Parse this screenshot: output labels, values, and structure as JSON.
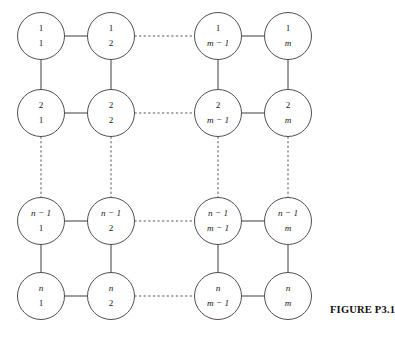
{
  "figure": {
    "caption": "FIGURE P3.1",
    "caption_x": 330,
    "caption_y": 304,
    "background_color": "#ffffff",
    "stroke_color": "#3c3c3c",
    "text_color": "#1a1a1a"
  },
  "diagram": {
    "type": "grid-graph",
    "rows": 4,
    "cols": 4,
    "radius": 23.5,
    "row_labels": [
      "1",
      "2",
      "n − 1",
      "n"
    ],
    "col_labels": [
      "1",
      "2",
      "m − 1",
      "m"
    ],
    "row_centers": [
      36,
      113,
      221,
      296
    ],
    "col_centers": [
      41,
      111,
      218,
      288
    ],
    "row_label_italic": [
      false,
      false,
      true,
      true
    ],
    "col_label_italic": [
      false,
      false,
      true,
      true
    ],
    "nodes": [
      {
        "id": "n-0-0",
        "row": 0,
        "col": 0,
        "top": "1",
        "bottom": "1",
        "top_italic": false,
        "bottom_italic": false,
        "cx": 41,
        "cy": 36
      },
      {
        "id": "n-0-1",
        "row": 0,
        "col": 1,
        "top": "1",
        "bottom": "2",
        "top_italic": false,
        "bottom_italic": false,
        "cx": 111,
        "cy": 36
      },
      {
        "id": "n-0-2",
        "row": 0,
        "col": 2,
        "top": "1",
        "bottom": "m − 1",
        "top_italic": false,
        "bottom_italic": true,
        "cx": 218,
        "cy": 36
      },
      {
        "id": "n-0-3",
        "row": 0,
        "col": 3,
        "top": "1",
        "bottom": "m",
        "top_italic": false,
        "bottom_italic": true,
        "cx": 288,
        "cy": 36
      },
      {
        "id": "n-1-0",
        "row": 1,
        "col": 0,
        "top": "2",
        "bottom": "1",
        "top_italic": false,
        "bottom_italic": false,
        "cx": 41,
        "cy": 113
      },
      {
        "id": "n-1-1",
        "row": 1,
        "col": 1,
        "top": "2",
        "bottom": "2",
        "top_italic": false,
        "bottom_italic": false,
        "cx": 111,
        "cy": 113
      },
      {
        "id": "n-1-2",
        "row": 1,
        "col": 2,
        "top": "2",
        "bottom": "m − 1",
        "top_italic": false,
        "bottom_italic": true,
        "cx": 218,
        "cy": 113
      },
      {
        "id": "n-1-3",
        "row": 1,
        "col": 3,
        "top": "2",
        "bottom": "m",
        "top_italic": false,
        "bottom_italic": true,
        "cx": 288,
        "cy": 113
      },
      {
        "id": "n-2-0",
        "row": 2,
        "col": 0,
        "top": "n − 1",
        "bottom": "1",
        "top_italic": true,
        "bottom_italic": false,
        "cx": 41,
        "cy": 221
      },
      {
        "id": "n-2-1",
        "row": 2,
        "col": 1,
        "top": "n − 1",
        "bottom": "2",
        "top_italic": true,
        "bottom_italic": false,
        "cx": 111,
        "cy": 221
      },
      {
        "id": "n-2-2",
        "row": 2,
        "col": 2,
        "top": "n − 1",
        "bottom": "m − 1",
        "top_italic": true,
        "bottom_italic": true,
        "cx": 218,
        "cy": 221
      },
      {
        "id": "n-2-3",
        "row": 2,
        "col": 3,
        "top": "n − 1",
        "bottom": "m",
        "top_italic": true,
        "bottom_italic": true,
        "cx": 288,
        "cy": 221
      },
      {
        "id": "n-3-0",
        "row": 3,
        "col": 0,
        "top": "n",
        "bottom": "1",
        "top_italic": true,
        "bottom_italic": false,
        "cx": 41,
        "cy": 296
      },
      {
        "id": "n-3-1",
        "row": 3,
        "col": 1,
        "top": "n",
        "bottom": "2",
        "top_italic": true,
        "bottom_italic": false,
        "cx": 111,
        "cy": 296
      },
      {
        "id": "n-3-2",
        "row": 3,
        "col": 2,
        "top": "n",
        "bottom": "m − 1",
        "top_italic": true,
        "bottom_italic": true,
        "cx": 218,
        "cy": 296
      },
      {
        "id": "n-3-3",
        "row": 3,
        "col": 3,
        "top": "n",
        "bottom": "m",
        "top_italic": true,
        "bottom_italic": true,
        "cx": 288,
        "cy": 296
      }
    ],
    "edges": [
      {
        "id": "e-h-0-0",
        "style": "solid",
        "x1": 64.5,
        "y1": 36,
        "x2": 87.5,
        "y2": 36
      },
      {
        "id": "e-h-0-1",
        "style": "dashed",
        "x1": 134.5,
        "y1": 36,
        "x2": 194.5,
        "y2": 36
      },
      {
        "id": "e-h-0-2",
        "style": "solid",
        "x1": 241.5,
        "y1": 36,
        "x2": 264.5,
        "y2": 36
      },
      {
        "id": "e-h-1-0",
        "style": "solid",
        "x1": 64.5,
        "y1": 113,
        "x2": 87.5,
        "y2": 113
      },
      {
        "id": "e-h-1-1",
        "style": "dashed",
        "x1": 134.5,
        "y1": 113,
        "x2": 194.5,
        "y2": 113
      },
      {
        "id": "e-h-1-2",
        "style": "solid",
        "x1": 241.5,
        "y1": 113,
        "x2": 264.5,
        "y2": 113
      },
      {
        "id": "e-h-2-0",
        "style": "solid",
        "x1": 64.5,
        "y1": 221,
        "x2": 87.5,
        "y2": 221
      },
      {
        "id": "e-h-2-1",
        "style": "dashed",
        "x1": 134.5,
        "y1": 221,
        "x2": 194.5,
        "y2": 221
      },
      {
        "id": "e-h-2-2",
        "style": "solid",
        "x1": 241.5,
        "y1": 221,
        "x2": 264.5,
        "y2": 221
      },
      {
        "id": "e-h-3-0",
        "style": "solid",
        "x1": 64.5,
        "y1": 296,
        "x2": 87.5,
        "y2": 296
      },
      {
        "id": "e-h-3-1",
        "style": "dashed",
        "x1": 134.5,
        "y1": 296,
        "x2": 194.5,
        "y2": 296
      },
      {
        "id": "e-h-3-2",
        "style": "solid",
        "x1": 241.5,
        "y1": 296,
        "x2": 264.5,
        "y2": 296
      },
      {
        "id": "e-v-0-0",
        "style": "solid",
        "x1": 41,
        "y1": 59.5,
        "x2": 41,
        "y2": 89.5
      },
      {
        "id": "e-v-0-1",
        "style": "solid",
        "x1": 111,
        "y1": 59.5,
        "x2": 111,
        "y2": 89.5
      },
      {
        "id": "e-v-0-2",
        "style": "solid",
        "x1": 218,
        "y1": 59.5,
        "x2": 218,
        "y2": 89.5
      },
      {
        "id": "e-v-0-3",
        "style": "solid",
        "x1": 288,
        "y1": 59.5,
        "x2": 288,
        "y2": 89.5
      },
      {
        "id": "e-v-1-0",
        "style": "dashed",
        "x1": 41,
        "y1": 136.5,
        "x2": 41,
        "y2": 197.5
      },
      {
        "id": "e-v-1-1",
        "style": "dashed",
        "x1": 111,
        "y1": 136.5,
        "x2": 111,
        "y2": 197.5
      },
      {
        "id": "e-v-1-2",
        "style": "dashed",
        "x1": 218,
        "y1": 136.5,
        "x2": 218,
        "y2": 197.5
      },
      {
        "id": "e-v-1-3",
        "style": "dashed",
        "x1": 288,
        "y1": 136.5,
        "x2": 288,
        "y2": 197.5
      },
      {
        "id": "e-v-2-0",
        "style": "solid",
        "x1": 41,
        "y1": 244.5,
        "x2": 41,
        "y2": 272.5
      },
      {
        "id": "e-v-2-1",
        "style": "solid",
        "x1": 111,
        "y1": 244.5,
        "x2": 111,
        "y2": 272.5
      },
      {
        "id": "e-v-2-2",
        "style": "solid",
        "x1": 218,
        "y1": 244.5,
        "x2": 218,
        "y2": 272.5
      },
      {
        "id": "e-v-2-3",
        "style": "solid",
        "x1": 288,
        "y1": 244.5,
        "x2": 288,
        "y2": 272.5
      }
    ]
  }
}
